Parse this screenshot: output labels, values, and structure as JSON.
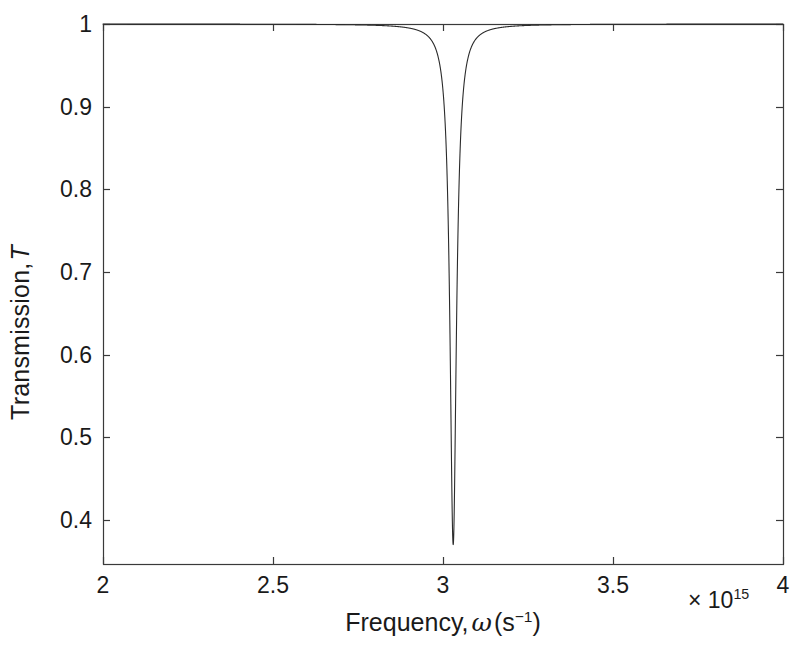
{
  "chart_data": {
    "type": "line",
    "title": "",
    "xlabel": "Frequency, ω (s−1)",
    "xlabel_parts": {
      "prefix": "Frequency,",
      "symbol": "ω",
      "units_base": "(s",
      "units_exp": "−1",
      "units_close": ")"
    },
    "ylabel": "Transmission, T",
    "ylabel_parts": {
      "prefix": "Transmission,",
      "symbol": "T"
    },
    "x_exponent_label": "× 10",
    "x_exponent_power": "15",
    "x_scale_factor": 1000000000000000.0,
    "xlim": [
      2,
      4
    ],
    "ylim": [
      0.3465,
      1.0
    ],
    "xticks": [
      2,
      2.5,
      3,
      3.5,
      4
    ],
    "xtick_labels": [
      "2",
      "2.5",
      "3",
      "3.5",
      "4"
    ],
    "yticks": [
      0.4,
      0.5,
      0.6,
      0.7,
      0.8,
      0.9,
      1
    ],
    "ytick_labels": [
      "0.4",
      "0.5",
      "0.6",
      "0.7",
      "0.8",
      "0.9",
      "1"
    ],
    "grid": false,
    "legend": null,
    "box": true,
    "tick_direction": "in",
    "line_color": "#2b2b2b",
    "line_width": 1.1,
    "series": [
      {
        "name": "Transmission",
        "description": "Sharp Lorentzian absorption dip centred on the resonance frequency",
        "model": "lorentzian_dip",
        "resonance_x": 3.03,
        "minimum_y": 0.37,
        "baseline_y": 1.0,
        "half_width_x": 0.0115,
        "annotation": "T drops from 1 to a minimum of about 0.37 at ω ≈ 3.03×10^15 s^-1",
        "points": [
          [
            2.0,
            1.0
          ],
          [
            2.1,
            1.0
          ],
          [
            2.2,
            1.0
          ],
          [
            2.3,
            0.9999
          ],
          [
            2.4,
            0.9999
          ],
          [
            2.5,
            0.9998
          ],
          [
            2.6,
            0.9997
          ],
          [
            2.7,
            0.9995
          ],
          [
            2.75,
            0.9993
          ],
          [
            2.8,
            0.999
          ],
          [
            2.85,
            0.9985
          ],
          [
            2.875,
            0.998
          ],
          [
            2.9,
            0.9971
          ],
          [
            2.92,
            0.9959
          ],
          [
            2.94,
            0.9938
          ],
          [
            2.95,
            0.9921
          ],
          [
            2.96,
            0.9895
          ],
          [
            2.97,
            0.9853
          ],
          [
            2.98,
            0.9781
          ],
          [
            2.99,
            0.9644
          ],
          [
            2.995,
            0.9519
          ],
          [
            3.0,
            0.9309
          ],
          [
            3.005,
            0.8943
          ],
          [
            3.01,
            0.8321
          ],
          [
            3.0125,
            0.7858
          ],
          [
            3.015,
            0.7298
          ],
          [
            3.0175,
            0.6677
          ],
          [
            3.02,
            0.6046
          ],
          [
            3.0225,
            0.5463
          ],
          [
            3.025,
            0.4972
          ],
          [
            3.0275,
            0.4596
          ],
          [
            3.03,
            0.37
          ],
          [
            3.0325,
            0.4596
          ],
          [
            3.035,
            0.4972
          ],
          [
            3.0375,
            0.5463
          ],
          [
            3.04,
            0.6046
          ],
          [
            3.0425,
            0.6677
          ],
          [
            3.045,
            0.7298
          ],
          [
            3.0475,
            0.7858
          ],
          [
            3.05,
            0.8321
          ],
          [
            3.055,
            0.8943
          ],
          [
            3.06,
            0.9309
          ],
          [
            3.065,
            0.9519
          ],
          [
            3.07,
            0.9644
          ],
          [
            3.08,
            0.9781
          ],
          [
            3.09,
            0.9853
          ],
          [
            3.1,
            0.9895
          ],
          [
            3.11,
            0.9921
          ],
          [
            3.12,
            0.9938
          ],
          [
            3.14,
            0.9959
          ],
          [
            3.16,
            0.9971
          ],
          [
            3.2,
            0.9985
          ],
          [
            3.25,
            0.9992
          ],
          [
            3.3,
            0.9995
          ],
          [
            3.4,
            0.9997
          ],
          [
            3.5,
            0.9998
          ],
          [
            3.6,
            0.9999
          ],
          [
            3.7,
            0.9999
          ],
          [
            3.8,
            1.0
          ],
          [
            3.9,
            1.0
          ],
          [
            4.0,
            1.0
          ]
        ]
      }
    ]
  },
  "plot_box": {
    "left": 103,
    "top": 24,
    "right": 783,
    "bottom": 564
  }
}
